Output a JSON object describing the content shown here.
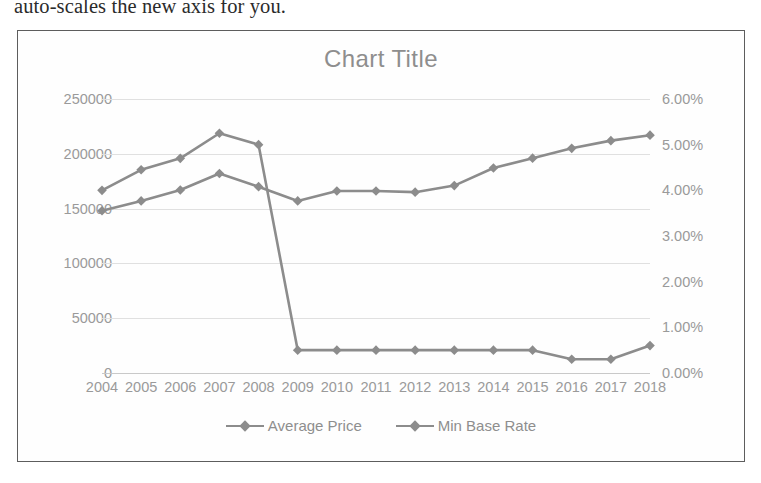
{
  "page": {
    "body_text": "auto-scales the new axis for you."
  },
  "chart": {
    "title": "Chart Title",
    "legend": [
      {
        "label": "Average Price",
        "color": "#8c8c8c",
        "marker": "diamond-marker"
      },
      {
        "label": "Min Base Rate",
        "color": "#8c8c8c",
        "marker": "diamond-marker"
      }
    ],
    "left_axis_ticks": [
      "250000",
      "200000",
      "150000",
      "100000",
      "50000",
      "0"
    ],
    "right_axis_ticks": [
      "6.00%",
      "5.00%",
      "4.00%",
      "3.00%",
      "2.00%",
      "1.00%",
      "0.00%"
    ],
    "colors": {
      "series_line": "#8c8c8c",
      "gridline": "#e0e0e0",
      "axis_text": "#9a9a9a",
      "title_text": "#8e8e8e",
      "frame_border": "#5d5d5d"
    }
  },
  "chart_data": {
    "type": "line",
    "title": "Chart Title",
    "xlabel": "",
    "ylabel": "",
    "grid": true,
    "legend_position": "bottom",
    "categories": [
      "2004",
      "2005",
      "2006",
      "2007",
      "2008",
      "2009",
      "2010",
      "2011",
      "2012",
      "2013",
      "2014",
      "2015",
      "2016",
      "2017",
      "2018"
    ],
    "axes": [
      {
        "name": "left",
        "label": "Average Price",
        "ylim": [
          0,
          250000
        ],
        "ticks": [
          0,
          50000,
          100000,
          150000,
          200000,
          250000
        ],
        "tick_labels": [
          "0",
          "50000",
          "100000",
          "150000",
          "200000",
          "250000"
        ]
      },
      {
        "name": "right",
        "label": "Min Base Rate",
        "ylim": [
          0,
          6
        ],
        "ticks": [
          0,
          1,
          2,
          3,
          4,
          5,
          6
        ],
        "tick_labels": [
          "0.00%",
          "1.00%",
          "2.00%",
          "3.00%",
          "4.00%",
          "5.00%",
          "6.00%"
        ],
        "unit": "percent"
      }
    ],
    "series": [
      {
        "name": "Average Price",
        "axis": "left",
        "color": "#8c8c8c",
        "marker": "diamond",
        "values": [
          148000,
          157000,
          167000,
          182000,
          170000,
          157000,
          166000,
          166000,
          165000,
          171000,
          187000,
          196000,
          205000,
          212000,
          217000
        ]
      },
      {
        "name": "Min Base Rate",
        "axis": "right",
        "color": "#8c8c8c",
        "marker": "diamond",
        "values": [
          4.0,
          4.45,
          4.7,
          5.25,
          5.0,
          0.5,
          0.5,
          0.5,
          0.5,
          0.5,
          0.5,
          0.5,
          0.3,
          0.3,
          0.6
        ]
      }
    ]
  }
}
